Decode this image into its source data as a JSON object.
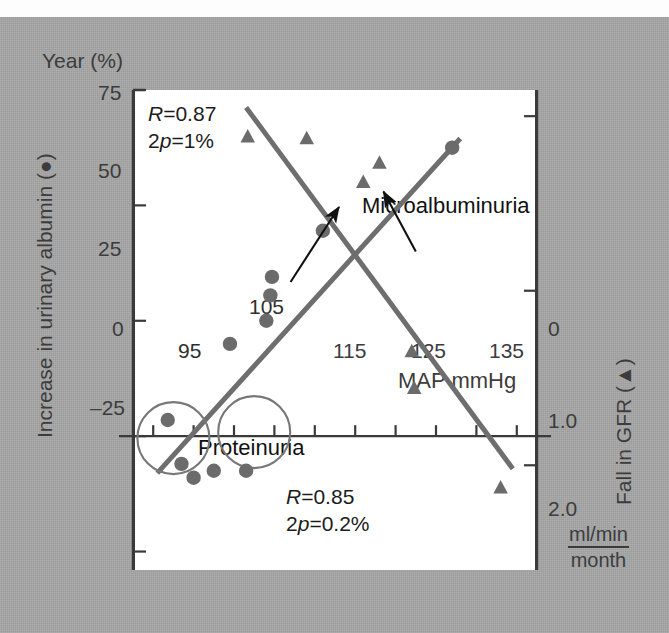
{
  "figure": {
    "top_caption": "",
    "background_color": "#a7a7a7",
    "panel_color": "#ffffff",
    "marker_color": "#6b6b6b",
    "line_color": "#6e6e6e",
    "axis_color": "#3a3a3a"
  },
  "chart_data": {
    "type": "scatter",
    "title": "",
    "xlabel": "MAP mmHg",
    "xlim": [
      90,
      140
    ],
    "xticks": [
      95,
      105,
      115,
      125,
      135
    ],
    "xtick_labels": [
      "95",
      "105",
      "115",
      "125",
      "135"
    ],
    "xminor_step": 5,
    "grid": false,
    "legend": "none",
    "left_axis": {
      "label_line1": "Year (%)",
      "label_line2": "Increase in urinary albumin (●)",
      "ylim": [
        -29,
        75
      ],
      "yticks": [
        75,
        50,
        25,
        0,
        -25
      ],
      "ytick_labels": [
        "75",
        "50",
        "25",
        "0",
        "–25"
      ]
    },
    "right_axis": {
      "label": "Fall in GFR (▲)",
      "unit_numerator": "ml/min",
      "unit_denominator": "month",
      "ylim": [
        -0.15,
        2.6
      ],
      "yticks": [
        0,
        1.0,
        2.0
      ],
      "ytick_labels": [
        "0",
        "1.0",
        "2.0"
      ]
    },
    "series": [
      {
        "name": "Microalbuminuria",
        "marker": "circle",
        "axis": "left",
        "color": "#6b6b6b",
        "stats": {
          "R_label": "R",
          "R_value": "0.87",
          "p_label": "2p",
          "p_value": "1%"
        },
        "points": [
          {
            "x": 94.3,
            "y": 3.5
          },
          {
            "x": 96.0,
            "y": -6.0
          },
          {
            "x": 97.5,
            "y": -9.0
          },
          {
            "x": 100.0,
            "y": -7.5
          },
          {
            "x": 104.0,
            "y": -7.5
          },
          {
            "x": 102.0,
            "y": 20.0
          },
          {
            "x": 106.5,
            "y": 25.0
          },
          {
            "x": 107.0,
            "y": 30.5
          },
          {
            "x": 107.2,
            "y": 34.5
          },
          {
            "x": 113.5,
            "y": 44.5
          },
          {
            "x": 129.5,
            "y": 62.5
          }
        ],
        "fit_line": {
          "x1": 93.0,
          "y1": -8.0,
          "x2": 130.5,
          "y2": 64.5
        },
        "annotation": {
          "text": "Microalbuminuria",
          "arrow_from": {
            "x": 125.0,
            "y": 40.0
          },
          "arrow_to": {
            "x": 121.0,
            "y": 53.0
          }
        }
      },
      {
        "name": "Proteinuria",
        "marker": "triangle",
        "axis": "right",
        "color": "#6b6b6b",
        "stats": {
          "R_label": "R",
          "R_value": "0.85",
          "p_label": "2p",
          "p_value": "0.2%"
        },
        "points": [
          {
            "x": 104.2,
            "y": 0.12
          },
          {
            "x": 111.5,
            "y": 0.13
          },
          {
            "x": 118.5,
            "y": 0.38
          },
          {
            "x": 120.5,
            "y": 0.27
          },
          {
            "x": 124.5,
            "y": 1.35
          },
          {
            "x": 124.8,
            "y": 1.56
          },
          {
            "x": 135.5,
            "y": 2.13
          }
        ],
        "fit_line": {
          "x1": 104.0,
          "y1": -0.05,
          "x2": 137.0,
          "y2": 2.02
        },
        "annotation": {
          "text": "Proteinuria",
          "arrow_from": {
            "x": 109.5,
            "y": 0.95
          },
          "arrow_to": {
            "x": 115.5,
            "y": 0.52
          }
        }
      }
    ],
    "highlight_circles": [
      {
        "label": "95",
        "cx": 95.0,
        "label_pos": "below"
      },
      {
        "label": "105",
        "cx": 105.0,
        "label_pos": "above"
      }
    ]
  }
}
